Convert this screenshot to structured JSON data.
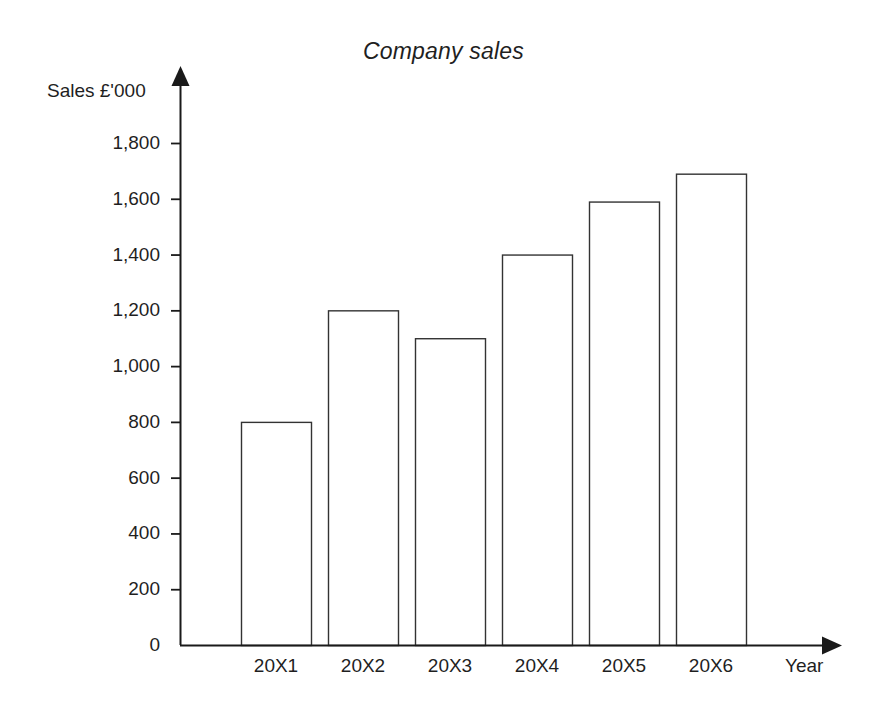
{
  "chart_data": {
    "type": "bar",
    "title": "Company sales",
    "xlabel": "Year",
    "ylabel": "Sales £'000",
    "categories": [
      "20X1",
      "20X2",
      "20X3",
      "20X4",
      "20X5",
      "20X6"
    ],
    "values": [
      800,
      1200,
      1100,
      1400,
      1590,
      1690
    ],
    "ylim": [
      0,
      1800
    ],
    "ytick_values": [
      0,
      200,
      400,
      600,
      800,
      1000,
      1200,
      1400,
      1600,
      1800
    ],
    "ytick_labels": [
      "0",
      "200",
      "400",
      "600",
      "800",
      "1,000",
      "1,200",
      "1,400",
      "1,600",
      "1,800"
    ],
    "grid": false,
    "legend": null,
    "bar_fill_color": "#ffffff",
    "bar_edge_color": "#333333",
    "axis_color": "#1a1a1a",
    "background_color": "#ffffff",
    "y_axis_has_arrow": true,
    "x_axis_has_arrow": true
  }
}
